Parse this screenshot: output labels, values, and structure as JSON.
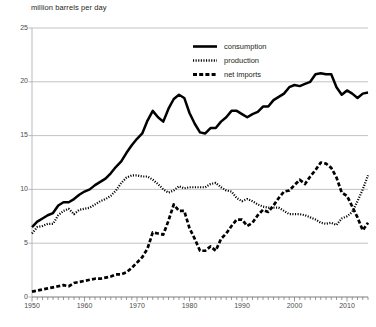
{
  "chart_data": {
    "type": "line",
    "title": "million barrels per day",
    "xlabel": "",
    "ylabel": "million barrels per day",
    "xlim": [
      1950,
      2014
    ],
    "ylim": [
      0,
      25
    ],
    "ytick_labels": [
      "0",
      "5",
      "10",
      "15",
      "20",
      "25"
    ],
    "ytick_values": [
      0,
      5,
      10,
      15,
      20,
      25
    ],
    "xtick_labels": [
      "1950",
      "1960",
      "1970",
      "1980",
      "1990",
      "2000",
      "2010"
    ],
    "xtick_values": [
      1950,
      1960,
      1970,
      1980,
      1990,
      2000,
      2010
    ],
    "minor_xticks": "annual",
    "grid": "horizontal",
    "legend_position": "upper-center",
    "x": [
      1950,
      1951,
      1952,
      1953,
      1954,
      1955,
      1956,
      1957,
      1958,
      1959,
      1960,
      1961,
      1962,
      1963,
      1964,
      1965,
      1966,
      1967,
      1968,
      1969,
      1970,
      1971,
      1972,
      1973,
      1974,
      1975,
      1976,
      1977,
      1978,
      1979,
      1980,
      1981,
      1982,
      1983,
      1984,
      1985,
      1986,
      1987,
      1988,
      1989,
      1990,
      1991,
      1992,
      1993,
      1994,
      1995,
      1996,
      1997,
      1998,
      1999,
      2000,
      2001,
      2002,
      2003,
      2004,
      2005,
      2006,
      2007,
      2008,
      2009,
      2010,
      2011,
      2012,
      2013,
      2014
    ],
    "series": [
      {
        "name": "consumption",
        "style": "solid",
        "values": [
          6.5,
          7.0,
          7.3,
          7.6,
          7.8,
          8.5,
          8.8,
          8.8,
          9.1,
          9.5,
          9.8,
          10.0,
          10.4,
          10.7,
          11.0,
          11.5,
          12.1,
          12.6,
          13.4,
          14.1,
          14.7,
          15.2,
          16.4,
          17.3,
          16.7,
          16.3,
          17.5,
          18.4,
          18.8,
          18.5,
          17.1,
          16.1,
          15.3,
          15.2,
          15.7,
          15.7,
          16.3,
          16.7,
          17.3,
          17.3,
          17.0,
          16.7,
          17.0,
          17.2,
          17.7,
          17.7,
          18.3,
          18.6,
          18.9,
          19.5,
          19.7,
          19.6,
          19.8,
          20.0,
          20.7,
          20.8,
          20.7,
          20.7,
          19.5,
          18.8,
          19.2,
          18.9,
          18.5,
          18.9,
          19.0
        ]
      },
      {
        "name": "production",
        "style": "dotted",
        "values": [
          5.9,
          6.5,
          6.6,
          6.8,
          6.8,
          7.6,
          8.0,
          8.2,
          7.7,
          8.1,
          8.2,
          8.3,
          8.6,
          8.9,
          9.1,
          9.4,
          9.9,
          10.6,
          11.1,
          11.3,
          11.3,
          11.2,
          11.2,
          10.9,
          10.5,
          10.0,
          9.7,
          9.9,
          10.3,
          10.1,
          10.2,
          10.2,
          10.2,
          10.2,
          10.5,
          10.6,
          10.2,
          9.9,
          9.8,
          9.2,
          8.9,
          9.1,
          8.9,
          8.6,
          8.4,
          8.3,
          8.3,
          8.3,
          8.0,
          7.7,
          7.7,
          7.7,
          7.6,
          7.4,
          7.2,
          6.9,
          6.8,
          6.9,
          6.7,
          7.3,
          7.5,
          7.9,
          8.9,
          10.0,
          11.3
        ]
      },
      {
        "name": "net imports",
        "style": "dashed",
        "values": [
          0.5,
          0.6,
          0.7,
          0.8,
          0.9,
          1.0,
          1.1,
          1.0,
          1.3,
          1.4,
          1.5,
          1.6,
          1.7,
          1.7,
          1.8,
          1.9,
          2.1,
          2.1,
          2.3,
          2.7,
          3.2,
          3.7,
          4.5,
          6.0,
          5.9,
          5.8,
          7.1,
          8.6,
          8.0,
          8.0,
          6.4,
          5.4,
          4.3,
          4.3,
          4.7,
          4.3,
          5.4,
          5.9,
          6.6,
          7.2,
          7.2,
          6.6,
          6.9,
          7.6,
          8.1,
          7.9,
          8.5,
          9.2,
          9.8,
          9.9,
          10.4,
          10.9,
          10.5,
          11.2,
          11.8,
          12.5,
          12.4,
          12.0,
          11.1,
          9.7,
          9.4,
          8.4,
          7.4,
          6.2,
          6.9
        ]
      }
    ]
  },
  "legend": {
    "items": [
      {
        "label": "consumption",
        "style": "solid"
      },
      {
        "label": "production",
        "style": "dotted"
      },
      {
        "label": "net imports",
        "style": "dashed"
      }
    ]
  }
}
